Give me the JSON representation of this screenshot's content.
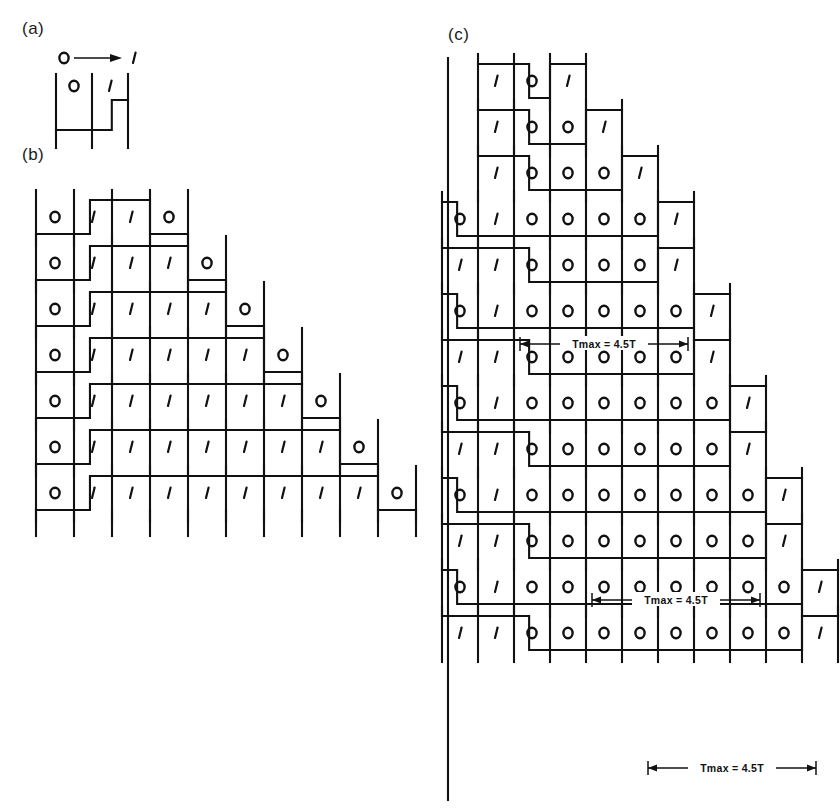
{
  "figure": {
    "type": "digital-waveform-timing-diagram",
    "background": "#ffffff",
    "ink": "#111111",
    "panels": [
      {
        "id": "a",
        "label": "(a)",
        "label_x": 22,
        "label_y": 34,
        "transition_legend": {
          "from": "0",
          "to": "1",
          "arrow": "right-arrow-icon"
        },
        "origin_x": 56,
        "origin_y": 78,
        "cell_w": 36,
        "high": 30,
        "rows": [
          {
            "bits": [
              "0",
              "1"
            ],
            "levels": [
              0,
              1
            ],
            "tail": 1
          }
        ]
      },
      {
        "id": "b",
        "label": "(b)",
        "label_x": 22,
        "label_y": 160,
        "origin_x": 36,
        "origin_y": 196,
        "cell_w": 38,
        "row_h": 46,
        "rows": [
          {
            "bits": [
              "0",
              "1",
              "1",
              "0"
            ]
          },
          {
            "bits": [
              "0",
              "1",
              "1",
              "1",
              "0"
            ]
          },
          {
            "bits": [
              "0",
              "1",
              "1",
              "1",
              "1",
              "0"
            ]
          },
          {
            "bits": [
              "0",
              "1",
              "1",
              "1",
              "1",
              "1",
              "0"
            ]
          },
          {
            "bits": [
              "0",
              "1",
              "1",
              "1",
              "1",
              "1",
              "1",
              "0"
            ]
          },
          {
            "bits": [
              "0",
              "1",
              "1",
              "1",
              "1",
              "1",
              "1",
              "1",
              "0"
            ]
          },
          {
            "bits": [
              "0",
              "1",
              "1",
              "1",
              "1",
              "1",
              "1",
              "1",
              "1",
              "0"
            ]
          }
        ]
      },
      {
        "id": "c",
        "label": "(c)",
        "label_x": 448,
        "label_y": 40,
        "origin_x": 478,
        "origin_y": 62,
        "cell_w": 36,
        "row_h": 46,
        "pair_gap": 18,
        "rows": [
          {
            "bits": [
              "1",
              "0",
              "1"
            ],
            "lead": 1
          },
          {
            "bits": [
              "1",
              "0",
              "0",
              "1"
            ],
            "lead": 1
          },
          {
            "bits": [
              "1",
              "0",
              "0",
              "0",
              "1"
            ],
            "lead": 1
          },
          {
            "bits": [
              "0",
              "1",
              "0",
              "0",
              "0",
              "0",
              "1"
            ],
            "lead": 0
          },
          {
            "bits": [
              "1",
              "1",
              "0",
              "0",
              "0",
              "0",
              "1"
            ],
            "lead": 0
          },
          {
            "bits": [
              "0",
              "1",
              "0",
              "0",
              "0",
              "0",
              "0",
              "1"
            ],
            "lead": 0
          },
          {
            "bits": [
              "1",
              "1",
              "0",
              "0",
              "0",
              "0",
              "0",
              "1"
            ],
            "lead": 0
          },
          {
            "bits": [
              "0",
              "1",
              "0",
              "0",
              "0",
              "0",
              "0",
              "0",
              "1"
            ],
            "lead": 0
          },
          {
            "bits": [
              "1",
              "1",
              "0",
              "0",
              "0",
              "0",
              "0",
              "0",
              "1"
            ],
            "lead": 0
          },
          {
            "bits": [
              "0",
              "1",
              "0",
              "0",
              "0",
              "0",
              "0",
              "0",
              "0",
              "1"
            ],
            "lead": 0
          },
          {
            "bits": [
              "1",
              "1",
              "0",
              "0",
              "0",
              "0",
              "0",
              "0",
              "0",
              "1"
            ],
            "lead": 0
          },
          {
            "bits": [
              "0",
              "1",
              "0",
              "0",
              "0",
              "0",
              "0",
              "0",
              "0",
              "0",
              "1"
            ],
            "lead": 0
          },
          {
            "bits": [
              "1",
              "1",
              "0",
              "0",
              "0",
              "0",
              "0",
              "0",
              "0",
              "0",
              "1"
            ],
            "lead": 0
          }
        ],
        "dimension_annotations": [
          {
            "text": "Tmax = 4.5T",
            "x": 520,
            "y": 344,
            "w": 168
          },
          {
            "text": "Tmax = 4.5T",
            "x": 592,
            "y": 600,
            "w": 168
          },
          {
            "text": "Tmax = 4.5T",
            "x": 648,
            "y": 768,
            "w": 168
          }
        ]
      }
    ]
  }
}
